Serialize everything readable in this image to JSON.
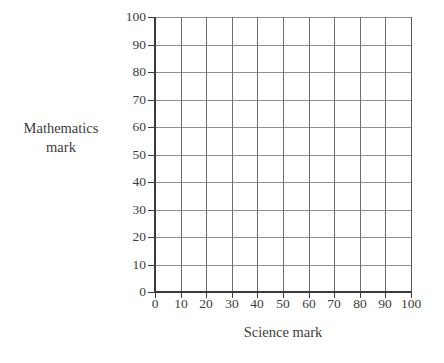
{
  "chart_data": {
    "type": "scatter",
    "title": "",
    "subtitle": "",
    "xlabel": "Science mark",
    "ylabel_line1": "Mathematics",
    "ylabel_line2": "mark",
    "ylabel": "Mathematics mark",
    "xlim": [
      0,
      100
    ],
    "ylim": [
      0,
      100
    ],
    "xticks": [
      "0",
      "10",
      "20",
      "30",
      "40",
      "50",
      "60",
      "70",
      "80",
      "90",
      "100"
    ],
    "yticks": [
      "100",
      "90",
      "80",
      "70",
      "60",
      "50",
      "40",
      "30",
      "20",
      "10",
      "0"
    ],
    "xtick_values": [
      0,
      10,
      20,
      30,
      40,
      50,
      60,
      70,
      80,
      90,
      100
    ],
    "ytick_values": [
      100,
      90,
      80,
      70,
      60,
      50,
      40,
      30,
      20,
      10,
      0
    ],
    "grid": true,
    "grid_columns": 10,
    "grid_rows": 10,
    "legend": null,
    "series": [
      {
        "name": "",
        "points": []
      }
    ],
    "annotations": [],
    "colors": {
      "background": "#ffffff",
      "axis": "#3c3c3c",
      "gridline_horizontal": "#909090",
      "gridline_vertical": "#6e6e6e",
      "text": "#3c3c3c"
    }
  }
}
